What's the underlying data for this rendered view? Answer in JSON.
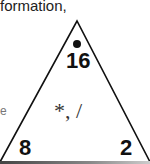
{
  "header": {
    "partial_text": "formation,"
  },
  "triangle": {
    "top_value": "16",
    "top_marker": "dot",
    "operations": "*, /",
    "bottom_left_value": "8",
    "bottom_right_value": "2",
    "stroke_color": "#111111"
  },
  "left_edge_fragment": "e"
}
